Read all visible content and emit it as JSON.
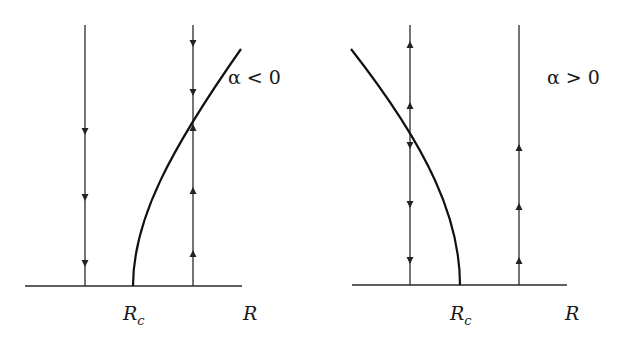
{
  "figure": {
    "panels": [
      {
        "id": "left",
        "condition_label": "α < 0",
        "axis_label": "R",
        "critical_label_main": "R",
        "critical_label_sub": "c",
        "baseline": {
          "x1": 25,
          "x2": 242,
          "y": 286
        },
        "verticals": [
          {
            "x": 85,
            "y_top": 25,
            "y_bottom": 286,
            "arrows": [
              {
                "y": 132,
                "dir": "down"
              },
              {
                "y": 198,
                "dir": "down"
              },
              {
                "y": 264,
                "dir": "down"
              }
            ]
          },
          {
            "x": 193,
            "y_top": 25,
            "y_bottom": 286,
            "arrows": [
              {
                "y": 44,
                "dir": "down"
              },
              {
                "y": 93,
                "dir": "down"
              },
              {
                "y": 127,
                "dir": "up"
              },
              {
                "y": 190,
                "dir": "up"
              },
              {
                "y": 253,
                "dir": "up"
              }
            ]
          }
        ],
        "curve_path": "M133,286 C133,220 170,150 241,49",
        "label_positions": {
          "condition": [
            228,
            84
          ],
          "Rc": [
            123,
            320
          ],
          "R": [
            243,
            320
          ]
        }
      },
      {
        "id": "right",
        "condition_label": "α > 0",
        "axis_label": "R",
        "critical_label_main": "R",
        "critical_label_sub": "c",
        "baseline": {
          "x1": 352,
          "x2": 567,
          "y": 285
        },
        "verticals": [
          {
            "x": 410,
            "y_top": 25,
            "y_bottom": 285,
            "arrows": [
              {
                "y": 44,
                "dir": "up"
              },
              {
                "y": 105,
                "dir": "up"
              },
              {
                "y": 146,
                "dir": "down"
              },
              {
                "y": 205,
                "dir": "down"
              },
              {
                "y": 261,
                "dir": "down"
              }
            ]
          },
          {
            "x": 519,
            "y_top": 25,
            "y_bottom": 285,
            "arrows": [
              {
                "y": 147,
                "dir": "up"
              },
              {
                "y": 206,
                "dir": "up"
              },
              {
                "y": 260,
                "dir": "up"
              }
            ]
          }
        ],
        "curve_path": "M460,285 C460,220 430,150 351,49",
        "label_positions": {
          "condition": [
            547,
            84
          ],
          "Rc": [
            450,
            320
          ],
          "R": [
            565,
            320
          ]
        }
      }
    ]
  },
  "labels": {
    "left_condition": "α < 0",
    "right_condition": "α > 0",
    "left_axis": "R",
    "right_axis": "R",
    "left_rc_main": "R",
    "left_rc_sub": "c",
    "right_rc_main": "R",
    "right_rc_sub": "c"
  }
}
